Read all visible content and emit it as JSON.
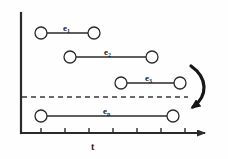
{
  "figure": {
    "type": "interval-timeline-diagram",
    "background_color": "#fefefe",
    "stroke_color": "#2a2a2a",
    "dashed_color": "#3a3a3a",
    "width": 228,
    "height": 159
  },
  "axes": {
    "x_label": "t",
    "x_axis": {
      "y": 133,
      "x_start": 21,
      "x_end": 205,
      "has_arrowhead": true
    },
    "y_axis": {
      "x": 21,
      "y_start": 13,
      "y_end": 133,
      "has_arrowhead": false
    },
    "ticks": [
      {
        "x": 41
      },
      {
        "x": 65
      },
      {
        "x": 89
      },
      {
        "x": 113
      },
      {
        "x": 137
      },
      {
        "x": 161
      },
      {
        "x": 185
      }
    ]
  },
  "threshold_line": {
    "name": "dashed-threshold",
    "y": 97,
    "x_start": 22,
    "x_end": 188,
    "style": "dashed"
  },
  "intervals": [
    {
      "id": "e1",
      "label": "e",
      "subscript": "1",
      "y": 33,
      "x_start": 41,
      "x_end": 94,
      "label_x": 63,
      "label_y": 24
    },
    {
      "id": "e2",
      "label": "e",
      "subscript": "2",
      "y": 57,
      "x_start": 70,
      "x_end": 152,
      "label_x": 104,
      "label_y": 48
    },
    {
      "id": "e3",
      "label": "e",
      "subscript": "3",
      "y": 83,
      "x_start": 121,
      "x_end": 180,
      "label_x": 145,
      "label_y": 74
    },
    {
      "id": "en",
      "label": "e",
      "subscript": "n",
      "y": 116,
      "x_start": 41,
      "x_end": 173,
      "label_x": 103,
      "label_y": 107
    }
  ],
  "endpoint_marker": {
    "shape": "circle",
    "radius": 6,
    "fill": "#ffffff",
    "stroke": "#2a2a2a"
  },
  "curved_arrow": {
    "name": "wrap-around-arrow",
    "description": "curved arrow sweeping from upper right down to the dashed threshold line",
    "path": "M 191 66 C 208 78, 208 96, 193 107",
    "arrowhead_at": "end"
  }
}
